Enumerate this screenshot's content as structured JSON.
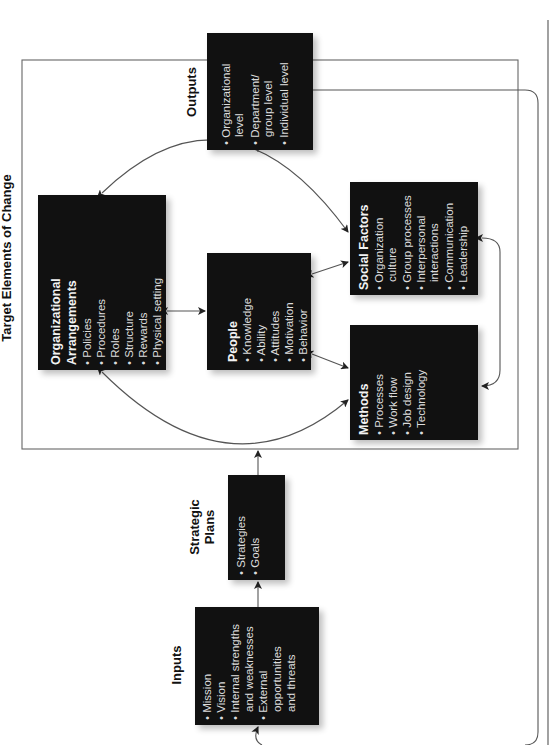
{
  "diagram": {
    "orientation": "rotated 90deg counterclockwise",
    "frame_title": "Target Elements of Change",
    "colors": {
      "box_fill": "#111111",
      "box_text": "#dcdcdc",
      "line": "#555555",
      "background": "#ffffff"
    },
    "nodes": {
      "inputs": {
        "label": "Inputs",
        "items": [
          "Mission",
          "Vision",
          "Internal strengths",
          "and weaknesses",
          "External",
          "opportunities",
          "and threats"
        ]
      },
      "strategic_plans": {
        "label_line1": "Strategic",
        "label_line2": "Plans",
        "items": [
          "Strategies",
          "Goals"
        ]
      },
      "org_arrangements": {
        "title_line1": "Organizational",
        "title_line2": "Arrangements",
        "items": [
          "Policies",
          "Procedures",
          "Roles",
          "Structure",
          "Rewards",
          "Physical setting"
        ]
      },
      "people": {
        "title": "People",
        "items": [
          "Knowledge",
          "Ability",
          "Attitudes",
          "Motivation",
          "Behavior"
        ]
      },
      "social_factors": {
        "title": "Social Factors",
        "items": [
          "Organization",
          "culture",
          "Group processes",
          "Interpersonal",
          "interactions",
          "Communication",
          "Leadership"
        ]
      },
      "methods": {
        "title": "Methods",
        "items": [
          "Processes",
          "Work flow",
          "Job design",
          "Technology"
        ]
      },
      "outputs": {
        "label": "Outputs",
        "items": [
          "Organizational",
          "level",
          "Department/",
          "group level",
          "Individual level"
        ]
      }
    },
    "bullet": "•"
  }
}
